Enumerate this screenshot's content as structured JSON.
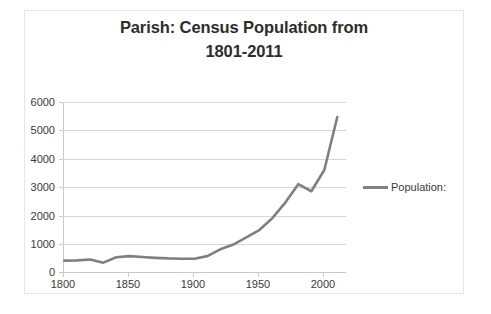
{
  "chart_data": {
    "type": "line",
    "title": "Parish: Census Population from 1801-2011",
    "title_lines": [
      "Parish: Census Population from",
      "1801-2011"
    ],
    "xlabel": "",
    "ylabel": "",
    "xlim": [
      1795,
      2015
    ],
    "ylim": [
      0,
      6000
    ],
    "xticks": [
      1800,
      1850,
      1900,
      1950,
      2000
    ],
    "yticks": [
      0,
      1000,
      2000,
      3000,
      4000,
      5000,
      6000
    ],
    "grid": true,
    "legend_position": "right",
    "series": [
      {
        "name": "Population:",
        "color": "#808080",
        "x": [
          1801,
          1811,
          1821,
          1831,
          1841,
          1851,
          1861,
          1871,
          1881,
          1891,
          1901,
          1911,
          1921,
          1931,
          1951,
          1961,
          1971,
          1981,
          1991,
          2001,
          2011
        ],
        "values": [
          400,
          410,
          440,
          330,
          520,
          560,
          530,
          500,
          480,
          470,
          470,
          560,
          800,
          970,
          1480,
          1900,
          2450,
          3100,
          2850,
          3600,
          5470
        ]
      }
    ]
  },
  "axes": {
    "y_tick_labels": [
      "6000",
      "5000",
      "4000",
      "3000",
      "2000",
      "1000",
      "0"
    ],
    "x_tick_labels": [
      "1800",
      "1850",
      "1900",
      "1950",
      "2000"
    ]
  },
  "legend": {
    "entries": [
      {
        "label": "Population:",
        "color": "#808080"
      }
    ]
  },
  "colors": {
    "series": "#808080",
    "grid": "#d6d6d6",
    "axis": "#c9c9c9",
    "text": "#3a3a3a",
    "title": "#2d2d2d",
    "frame": "#e6e6e6"
  }
}
